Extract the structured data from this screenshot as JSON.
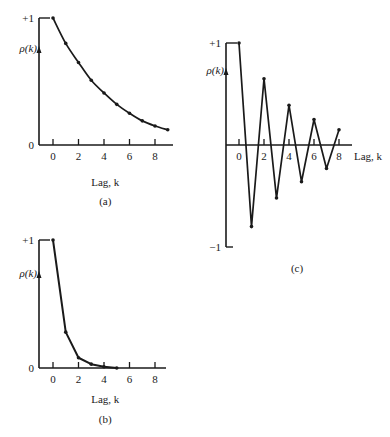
{
  "figure": {
    "panels": [
      {
        "id": "a",
        "caption": "(a)",
        "ylabel": "ρ(k)",
        "xlabel": "Lag, k",
        "ytop_label": "+1",
        "yzero_label": "0",
        "x_ticks": [
          "0",
          "2",
          "4",
          "6",
          "8"
        ]
      },
      {
        "id": "b",
        "caption": "(b)",
        "ylabel": "ρ(k)",
        "xlabel": "Lag, k",
        "ytop_label": "+1",
        "yzero_label": "0",
        "x_ticks": [
          "0",
          "2",
          "4",
          "6",
          "8"
        ]
      },
      {
        "id": "c",
        "caption": "(c)",
        "ylabel": "ρ(k)",
        "xlabel": "Lag, k",
        "ytop_label": "+1",
        "ybottom_label": "−1",
        "x_ticks": [
          "0",
          "2",
          "4",
          "6",
          "8"
        ]
      }
    ]
  },
  "chart_data": [
    {
      "type": "line",
      "title": "(a)",
      "xlabel": "Lag, k",
      "ylabel": "ρ(k)",
      "x": [
        0,
        1,
        2,
        3,
        4,
        5,
        6,
        7,
        8,
        9
      ],
      "values": [
        1.0,
        0.8,
        0.65,
        0.51,
        0.41,
        0.32,
        0.25,
        0.19,
        0.15,
        0.12
      ],
      "ylim": [
        0,
        1
      ],
      "xticks": [
        0,
        2,
        4,
        6,
        8
      ],
      "yticks_labels": [
        "0",
        "+1"
      ],
      "grid": false,
      "legend": null
    },
    {
      "type": "line",
      "title": "(b)",
      "xlabel": "Lag, k",
      "ylabel": "ρ(k)",
      "x": [
        0,
        1,
        2,
        3,
        4,
        5
      ],
      "values": [
        1.0,
        0.28,
        0.08,
        0.03,
        0.01,
        0.0
      ],
      "ylim": [
        0,
        1
      ],
      "xticks": [
        0,
        2,
        4,
        6,
        8
      ],
      "yticks_labels": [
        "0",
        "+1"
      ],
      "grid": false,
      "legend": null
    },
    {
      "type": "line",
      "title": "(c)",
      "xlabel": "Lag, k",
      "ylabel": "ρ(k)",
      "x": [
        0,
        1,
        2,
        3,
        4,
        5,
        6,
        7,
        8
      ],
      "values": [
        1.0,
        -0.8,
        0.65,
        -0.52,
        0.39,
        -0.36,
        0.25,
        -0.23,
        0.15
      ],
      "ylim": [
        -1,
        1
      ],
      "xticks": [
        0,
        2,
        4,
        6,
        8
      ],
      "yticks_labels": [
        "−1",
        "+1"
      ],
      "grid": false,
      "legend": null
    }
  ]
}
